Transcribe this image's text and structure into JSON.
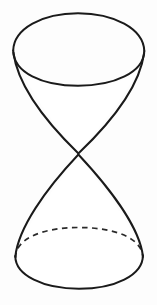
{
  "figure": {
    "kind": "geometric-solid-line-drawing",
    "caption": "",
    "canvas": {
      "width": 157,
      "height": 305,
      "background_color": "#fdfdfd"
    },
    "style": {
      "solid_stroke_color": "#1a1a1a",
      "solid_stroke_width": 2,
      "hidden_stroke_color": "#2a2a2a",
      "hidden_stroke_width": 1.7,
      "hidden_dash_pattern": "5.5 4.5",
      "surface_fill_color": "#ffffff"
    },
    "parts": [
      {
        "name": "top-ellipse",
        "role": "upper nappe circular base seen in perspective",
        "line_style": "solid",
        "center_x": 78,
        "center_y": 49.5,
        "radius_x": 65,
        "radius_y": 36
      },
      {
        "name": "bottom-ellipse",
        "role": "lower nappe circular base seen in perspective",
        "line_style": "solid front arc, dashed back arc",
        "center_x": 79,
        "center_y": 258,
        "radius_x": 64,
        "radius_y": 31
      },
      {
        "name": "apex",
        "role": "common vertex where the two nappes touch",
        "x": 78,
        "y": 154
      },
      {
        "name": "upper-left-generatrix",
        "line_style": "solid"
      },
      {
        "name": "upper-right-generatrix",
        "line_style": "solid"
      },
      {
        "name": "lower-left-generatrix",
        "line_style": "solid"
      },
      {
        "name": "lower-right-generatrix",
        "line_style": "solid"
      }
    ]
  }
}
